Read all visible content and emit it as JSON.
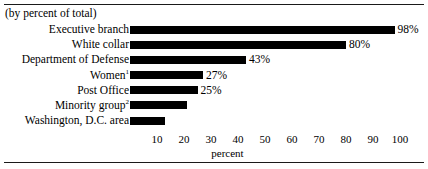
{
  "figure": {
    "subtitle": "(by percent of total)",
    "axis_title": "percent"
  },
  "chart_data": {
    "type": "bar",
    "orientation": "horizontal",
    "title": "",
    "subtitle": "(by percent of total)",
    "xlabel": "percent",
    "ylabel": "",
    "xlim": [
      0,
      100
    ],
    "xticks": [
      10,
      20,
      30,
      40,
      50,
      60,
      70,
      80,
      90,
      100
    ],
    "xtick_labels": [
      "10",
      "20",
      "30",
      "40",
      "50",
      "60",
      "70",
      "80",
      "90",
      "100"
    ],
    "grid": false,
    "legend": "none",
    "bar_color": "#000000",
    "categories": [
      "Executive branch",
      "White collar",
      "Department of Defense",
      "Women",
      "Post Office",
      "Minority group",
      "Washington, D.C. area"
    ],
    "values": [
      98,
      80,
      43,
      27,
      25,
      21,
      13
    ],
    "value_labels": [
      "98%",
      "80%",
      "43%",
      "27%",
      "25%",
      "",
      ""
    ],
    "footnote_markers": [
      "",
      "",
      "",
      "1",
      "",
      "2",
      ""
    ],
    "bars": [
      {
        "label": "Executive branch",
        "value": 98,
        "value_label": "98%",
        "footnote": ""
      },
      {
        "label": "White collar",
        "value": 80,
        "value_label": "80%",
        "footnote": ""
      },
      {
        "label": "Department of Defense",
        "value": 43,
        "value_label": "43%",
        "footnote": ""
      },
      {
        "label": "Women",
        "value": 27,
        "value_label": "27%",
        "footnote": "1"
      },
      {
        "label": "Post Office",
        "value": 25,
        "value_label": "25%",
        "footnote": ""
      },
      {
        "label": "Minority group",
        "value": 21,
        "value_label": "",
        "footnote": "2"
      },
      {
        "label": "Washington, D.C. area",
        "value": 13,
        "value_label": "",
        "footnote": ""
      }
    ]
  }
}
